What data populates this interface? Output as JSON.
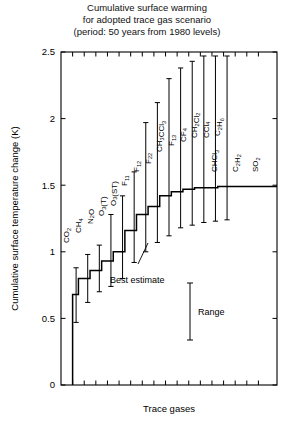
{
  "title": {
    "line1": "Cumulative surface warming",
    "line2": "for adopted trace gas scenario",
    "line3": "(period: 50 years from 1980 levels)"
  },
  "axes": {
    "ylabel": "Cumulative surface temperature change (K)",
    "xlabel": "Trace gases",
    "yticks": [
      "0",
      "0.5",
      "1",
      "1.5",
      "2",
      "2.5"
    ],
    "ylim": [
      0,
      2.5
    ]
  },
  "legend": {
    "best_estimate": "Best estimate",
    "range": "Range"
  },
  "chart_data": {
    "type": "bar",
    "title": "Cumulative surface warming for adopted trace gas scenario (period: 50 years from 1980 levels)",
    "xlabel": "Trace gases",
    "ylabel": "Cumulative surface temperature change (K)",
    "ylim": [
      0,
      2.5
    ],
    "grid": false,
    "legend_position": "inside-lower-right",
    "note": "Cumulative step profile: each gas adds its contribution to the running total. Error bars show the uncertainty range of the cumulative total after each gas.",
    "categories": [
      "CO2",
      "CH4",
      "N2O",
      "O3(T)",
      "O3(ST)",
      "F11",
      "F12",
      "F22",
      "CH3CCl3",
      "F13",
      "CF4",
      "CH2Cl2",
      "CCl4",
      "C2H6",
      "CHCl3",
      "C2H2",
      "SO2"
    ],
    "category_labels": [
      "CO₂",
      "CH₄",
      "N₂O",
      "O₃(T)",
      "O₃(ST)",
      "F₁₁",
      "F₁₂",
      "F₂₂",
      "CH₃CCl₃",
      "F₁₃",
      "CF₄",
      "CH₂Cl₂",
      "CCl₄",
      "C₂H₆",
      "CHCl₃",
      "C₂H₂",
      "SO₂"
    ],
    "cumulative_best_estimate": [
      0.68,
      0.8,
      0.86,
      0.93,
      1.0,
      1.16,
      1.28,
      1.34,
      1.42,
      1.45,
      1.47,
      1.48,
      1.48,
      1.49,
      1.49,
      1.49,
      1.49
    ],
    "range_low": [
      0.47,
      0.62,
      0.7,
      0.74,
      0.8,
      0.92,
      1.0,
      1.07,
      1.12,
      1.18,
      1.2,
      1.22,
      1.23,
      1.24,
      null,
      null,
      null
    ],
    "range_high": [
      0.88,
      0.98,
      1.05,
      1.28,
      1.42,
      1.6,
      1.97,
      2.12,
      2.3,
      2.38,
      2.43,
      2.47,
      2.47,
      2.47,
      null,
      null,
      null
    ],
    "label_orientation": [
      "vertical",
      "vertical",
      "vertical",
      "vertical",
      "vertical",
      "vertical",
      "vertical",
      "vertical",
      "vertical",
      "vertical",
      "vertical",
      "vertical",
      "vertical",
      "vertical",
      "horizontal",
      "horizontal",
      "horizontal"
    ]
  }
}
